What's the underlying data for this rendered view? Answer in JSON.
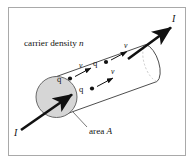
{
  "figure": {
    "background_color": "#ffffff",
    "frame": {
      "border_color": "#a8a8a8",
      "fill_color": "#ffffff",
      "x": 8,
      "y": 7,
      "width": 178,
      "height": 149
    },
    "colors": {
      "stroke": "#1a1a1a",
      "cylinder_outline": "#2b2b2b",
      "end_cap_fill": "#d4d4d4",
      "end_cap_stroke": "#4a4a4a",
      "text": "#1a1a1a",
      "leader_line": "#555555"
    },
    "labels": {
      "carrier_density": "carrier density n",
      "carrier_density_italic_part": "n",
      "area": "area A",
      "area_italic_part": "A",
      "current_in": "I",
      "current_out": "I",
      "charge": "q",
      "velocity": "v"
    },
    "charges": [
      {
        "id": "charge-1",
        "label": "q",
        "velocity_label": "v",
        "dot_x": 70,
        "dot_y": 78,
        "label_x": 60,
        "label_y": 80,
        "arrow_x1": 74,
        "arrow_y1": 76,
        "arrow_x2": 93,
        "arrow_y2": 66,
        "v_x": 92,
        "v_y": 64
      },
      {
        "id": "charge-2",
        "label": "q",
        "velocity_label": "v",
        "dot_x": 105,
        "dot_y": 62,
        "label_x": 95,
        "label_y": 65,
        "arrow_x1": 109,
        "arrow_y1": 60,
        "arrow_x2": 128,
        "arrow_y2": 50,
        "v_x": 127,
        "v_y": 48
      },
      {
        "id": "charge-3",
        "label": "q",
        "velocity_label": "v",
        "dot_x": 92,
        "dot_y": 88,
        "label_x": 82,
        "label_y": 91,
        "arrow_x1": 96,
        "arrow_y1": 86,
        "arrow_x2": 115,
        "arrow_y2": 76,
        "v_x": 114,
        "v_y": 74
      }
    ],
    "geometry": {
      "axis_angle_deg": -28,
      "current_arrow_in": {
        "x1": 21,
        "y1": 129,
        "x2": 75,
        "y2": 92
      },
      "current_arrow_out": {
        "x1": 130,
        "y1": 57,
        "x2": 172,
        "y2": 26
      },
      "end_cap_center": {
        "cx": 56,
        "cy": 97
      },
      "end_cap_radius": 20,
      "leader": {
        "x1": 74,
        "y1": 113,
        "x2": 88,
        "y2": 127
      }
    }
  }
}
